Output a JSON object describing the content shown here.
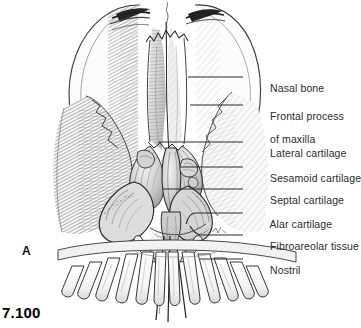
{
  "figure": {
    "number": "7.100",
    "panel_letter": "A",
    "caption_region": "anatomical-illustration",
    "background_color": "#ffffff",
    "ink_color": "#2b2b2b"
  },
  "labels": [
    {
      "id": "nasal-bone",
      "text": "Nasal bone",
      "text2": "",
      "x": 258,
      "y": 71,
      "leader": {
        "x1": 243,
        "y1": 77,
        "x2": 188,
        "y2": 77,
        "type": "straight"
      }
    },
    {
      "id": "frontal-process",
      "text": "Frontal process",
      "text2": "of maxilla",
      "x": 258,
      "y": 99,
      "leader": {
        "x1": 243,
        "y1": 105,
        "x2": 190,
        "y2": 105,
        "type": "straight"
      }
    },
    {
      "id": "lateral-cartilage",
      "text": "Lateral cartilage",
      "text2": "",
      "x": 258,
      "y": 136,
      "leader": {
        "x1": 243,
        "y1": 142,
        "x2": 158,
        "y2": 142,
        "type": "straight"
      }
    },
    {
      "id": "sesamoid-cartilage",
      "text": "Sesamoid cartilage",
      "text2": "",
      "x": 258,
      "y": 161,
      "leader": {
        "x1": 243,
        "y1": 167,
        "x2": 180,
        "y2": 167,
        "type": "straight"
      }
    },
    {
      "id": "septal-cartilage",
      "text": "Septal cartilage",
      "text2": "",
      "x": 258,
      "y": 183,
      "leader": {
        "x1": 243,
        "y1": 189,
        "x2": 163,
        "y2": 189,
        "type": "straight"
      }
    },
    {
      "id": "alar-cartilage",
      "text": "Alar cartilage",
      "text2": "",
      "x": 258,
      "y": 207,
      "leader": {
        "x1": 243,
        "y1": 213,
        "x2": 178,
        "y2": 213,
        "type": "hook-down"
      }
    },
    {
      "id": "fibroareolar-tissue",
      "text": "Fibroareolar tissue",
      "text2": "",
      "x": 258,
      "y": 229,
      "leader": {
        "x1": 243,
        "y1": 235,
        "x2": 196,
        "y2": 235,
        "type": "hook-up"
      }
    },
    {
      "id": "nostril",
      "text": "Nostril",
      "text2": "",
      "x": 258,
      "y": 253,
      "leader": {
        "x1": 243,
        "y1": 259,
        "x2": 200,
        "y2": 259,
        "type": "straight"
      }
    }
  ],
  "colors": {
    "leader_line": "#2b2b2b",
    "label_text": "#2b2b2b",
    "figure_number": "#000000",
    "shade_light": "#e9e9e9",
    "shade_mid": "#b9b9b9",
    "shade_dark": "#6e6e6e",
    "outline": "#333333"
  }
}
